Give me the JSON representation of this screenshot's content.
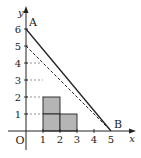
{
  "diagram": {
    "type": "coordinate-plane",
    "axis_labels": {
      "x": "x",
      "y": "y",
      "origin": "O"
    },
    "x_ticks": [
      "1",
      "2",
      "3",
      "4",
      "5"
    ],
    "y_ticks": [
      "1",
      "2",
      "3",
      "4",
      "5",
      "6"
    ],
    "points": [
      {
        "label": "A",
        "x": 0,
        "y": 6
      },
      {
        "label": "B",
        "x": 5,
        "y": 0
      }
    ],
    "solid_line": {
      "from": [
        0,
        6
      ],
      "to": [
        5,
        0
      ]
    },
    "dashed_line": {
      "from": [
        0,
        5
      ],
      "to": [
        5,
        0
      ]
    },
    "shaded_squares": [
      [
        1,
        2
      ],
      [
        2,
        2
      ],
      [
        1,
        1
      ],
      [
        2,
        1
      ]
    ],
    "colors": {
      "shade": "#b5b5b5",
      "line": "#222222"
    }
  }
}
